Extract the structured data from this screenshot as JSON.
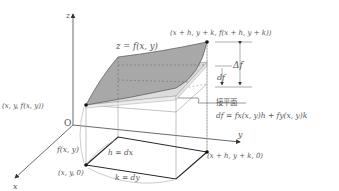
{
  "diagram": {
    "axes": {
      "z_label": "z",
      "y_label": "y",
      "x_label": "x",
      "origin_label": "O"
    },
    "labels": {
      "surface": "z = f(x, y)",
      "top_right_point": "(x + h, y + k, f(x + h, y + k))",
      "start_point": "(x, y, f(x, y))",
      "base_start": "(x, y, 0)",
      "base_end": "(x + h, y + k, 0)",
      "height": "f(x, y)",
      "h_edge": "h = dx",
      "k_edge": "k = dy",
      "delta_f": "Δf",
      "df": "df",
      "tangent_plane": "接平面",
      "df_formula": "df = fx(x, y)h + fy(x, y)k"
    },
    "colors": {
      "surface": "#a8a8a8",
      "tangent_plane": "#dcdcdc",
      "line": "#222222",
      "thin_line": "#9a9a9a",
      "text": "#555555"
    }
  }
}
